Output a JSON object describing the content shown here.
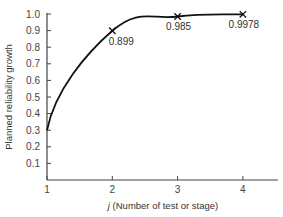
{
  "chart_data": {
    "type": "line",
    "title": "",
    "xlabel": "j (Number of test or stage)",
    "xlabel_italic_part": "j",
    "xlabel_rest": " (Number of test or stage)",
    "ylabel": "Planned reliability growth",
    "x": [
      1,
      2,
      3,
      4
    ],
    "series": [
      {
        "name": "Planned reliability growth",
        "values": [
          0.3,
          0.899,
          0.985,
          0.9978
        ],
        "labels": [
          "",
          "0.899",
          "0.985",
          "0.9978"
        ],
        "marker": "x",
        "color": "#111111"
      }
    ],
    "xticks": [
      "1",
      "2",
      "3",
      "4"
    ],
    "yticks": [
      "0.1",
      "0.2",
      "0.3",
      "0.4",
      "0.5",
      "0.6",
      "0.7",
      "0.8",
      "0.9",
      "1.0"
    ],
    "xlim": [
      1,
      4.5
    ],
    "ylim": [
      0,
      1.0
    ],
    "grid": false,
    "legend": "none"
  }
}
